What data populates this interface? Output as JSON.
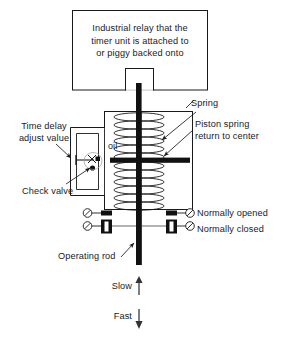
{
  "diagram": {
    "background_color": "#ffffff",
    "line_color": "#1a1a1a",
    "fill_color": "#111111"
  },
  "relay": {
    "text": "Industrial relay that the timer unit is attached to or piggy backed onto",
    "line1": "Industrial relay that the",
    "line2": "timer unit is attached to",
    "line3": "or piggy backed onto"
  },
  "labels": {
    "time_delay": "Time delay adjust value",
    "time_delay_line1": "Time delay",
    "time_delay_line2": "adjust value",
    "check_valve": "Check valve",
    "oil": "oil",
    "spring": "Spring",
    "piston_spring": "Piston spring return to center",
    "piston_line1": "Piston spring",
    "piston_line2": "return to center",
    "normally_opened": "Normally opened",
    "normally_closed": "Normally closed",
    "operating_rod": "Operating rod",
    "slow": "Slow",
    "fast": "Fast"
  },
  "arrows": {
    "slow_direction": "up",
    "fast_direction": "down",
    "slow_glyph": "↑",
    "fast_glyph": "↓"
  },
  "contacts": [
    {
      "name": "normally-opened",
      "label": "Normally opened",
      "state": "open"
    },
    {
      "name": "normally-closed",
      "label": "Normally closed",
      "state": "closed"
    }
  ]
}
